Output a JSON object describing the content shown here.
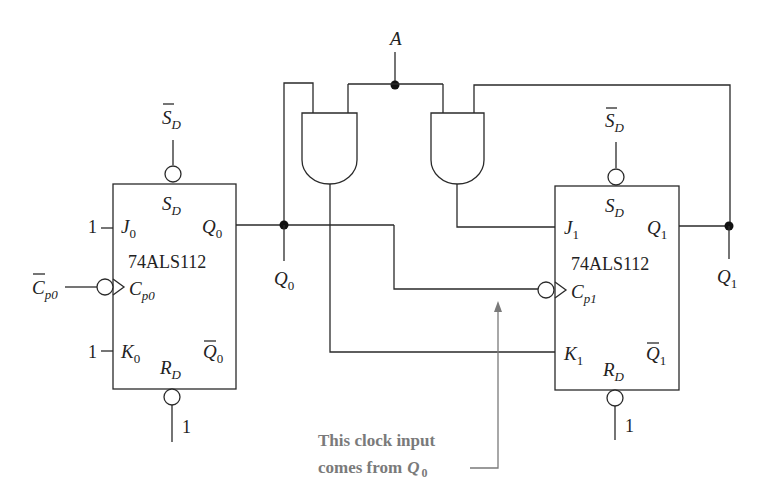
{
  "diagram": {
    "type": "logic-circuit",
    "input_A": {
      "label": "A"
    },
    "flipflop0": {
      "chip": "74ALS112",
      "set_pin_inside": {
        "main": "S",
        "sub": "D"
      },
      "set_pin_outside": {
        "main": "S",
        "sub": "D",
        "overbar": true
      },
      "reset_pin_inside": {
        "main": "R",
        "sub": "D"
      },
      "reset_tie": "1",
      "j": {
        "main": "J",
        "sub": "0",
        "tie": "1"
      },
      "k": {
        "main": "K",
        "sub": "0",
        "tie": "1"
      },
      "q": {
        "main": "Q",
        "sub": "0"
      },
      "qbar": {
        "main": "Q",
        "sub": "0",
        "overbar": true
      },
      "clock_inside": {
        "main": "C",
        "sub": "p0"
      },
      "clock_outside": {
        "main": "C",
        "sub": "p0",
        "overbar": true
      }
    },
    "flipflop1": {
      "chip": "74ALS112",
      "set_pin_inside": {
        "main": "S",
        "sub": "D"
      },
      "set_pin_outside": {
        "main": "S",
        "sub": "D",
        "overbar": true
      },
      "reset_pin_inside": {
        "main": "R",
        "sub": "D"
      },
      "reset_tie": "1",
      "j": {
        "main": "J",
        "sub": "1"
      },
      "k": {
        "main": "K",
        "sub": "1"
      },
      "q": {
        "main": "Q",
        "sub": "1"
      },
      "qbar": {
        "main": "Q",
        "sub": "1",
        "overbar": true
      },
      "clock_inside": {
        "main": "C",
        "sub": "p1"
      }
    },
    "output_labels": {
      "q0": {
        "main": "Q",
        "sub": "0"
      },
      "q1": {
        "main": "Q",
        "sub": "1"
      }
    },
    "gates": [
      {
        "type": "AND",
        "inputs": [
          "Q0",
          "A"
        ],
        "output_to": "K1"
      },
      {
        "type": "AND",
        "inputs": [
          "A",
          "Q1"
        ],
        "output_to": "J1"
      }
    ],
    "annotation": {
      "line1": "This clock input",
      "line2": "comes from",
      "var_main": "Q",
      "var_sub": "0",
      "color": "#7a7a7a"
    }
  }
}
